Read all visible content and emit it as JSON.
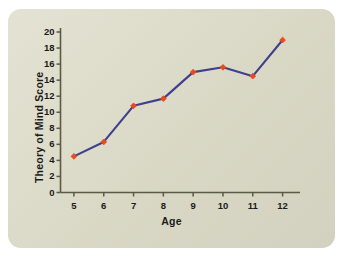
{
  "figure": {
    "card_background": "#dedcc9",
    "page_background": "#ffffff"
  },
  "chart_data": {
    "type": "line",
    "title": "",
    "xlabel": "Age",
    "ylabel": "Theory of Mind Score",
    "x": [
      5,
      6,
      7,
      8,
      9,
      10,
      11,
      12
    ],
    "values": [
      4.5,
      6.3,
      10.8,
      11.7,
      15.0,
      15.6,
      14.5,
      19.0
    ],
    "xtick_labels": [
      "5",
      "6",
      "7",
      "8",
      "9",
      "10",
      "11",
      "12"
    ],
    "ytick_labels": [
      "0",
      "2",
      "4",
      "6",
      "8",
      "10",
      "12",
      "14",
      "16",
      "18",
      "20"
    ],
    "ytick_values": [
      0,
      2,
      4,
      6,
      8,
      10,
      12,
      14,
      16,
      18,
      20
    ],
    "xlim": [
      4.55,
      12.45
    ],
    "ylim": [
      0,
      20
    ],
    "grid": false,
    "legend": "none",
    "line_color": "#3f3f8c",
    "marker_color": "#e8491f",
    "marker_shape": "diamond",
    "axis_color": "#5a5a45"
  }
}
